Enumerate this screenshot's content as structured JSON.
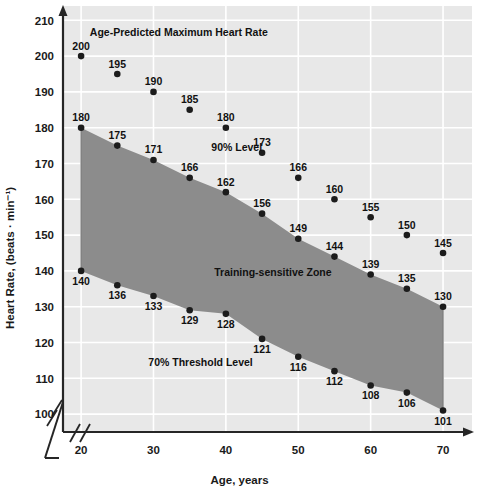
{
  "chart_data": {
    "type": "line",
    "title": "",
    "xlabel": "Age, years",
    "ylabel": "Heart Rate, (beats · min⁻¹)",
    "xlim": [
      17.5,
      74
    ],
    "ylim": [
      95,
      214
    ],
    "xticks": [
      20,
      30,
      40,
      50,
      60,
      70
    ],
    "yticks": [
      100,
      110,
      120,
      130,
      140,
      150,
      160,
      170,
      180,
      190,
      200,
      210
    ],
    "grid": true,
    "legend": "none",
    "axis_break_x": true,
    "axis_break_y": true,
    "x": [
      20,
      25,
      30,
      35,
      40,
      45,
      50,
      55,
      60,
      65,
      70
    ],
    "series": [
      {
        "name": "Age-Predicted Maximum Heart Rate",
        "values": [
          200,
          195,
          190,
          185,
          180,
          173,
          166,
          160,
          155,
          150,
          145
        ],
        "label_position": "above",
        "marker": "filled-circle",
        "line": false
      },
      {
        "name": "90% Level",
        "values": [
          180,
          175,
          171,
          166,
          162,
          156,
          149,
          144,
          139,
          135,
          130
        ],
        "label_position": "above",
        "marker": "filled-circle",
        "line": true
      },
      {
        "name": "70% Threshold Level",
        "values": [
          140,
          136,
          133,
          129,
          128,
          121,
          116,
          112,
          108,
          106,
          101
        ],
        "label_position": "below",
        "marker": "filled-circle",
        "line": true
      }
    ],
    "shaded_region": {
      "name": "Training-sensitive Zone",
      "upper_series": "90% Level",
      "lower_series": "70% Threshold Level",
      "color": "#8c8c8c"
    },
    "annotations": [
      {
        "text": "Age-Predicted Maximum Heart Rate",
        "x": 33.5,
        "y": 205.5
      },
      {
        "text": "90% Level",
        "x": 41.5,
        "y": 173.5
      },
      {
        "text": "Training-sensitive Zone",
        "x": 46.5,
        "y": 138.5
      },
      {
        "text": "70% Threshold Level",
        "x": 36.5,
        "y": 113.5
      }
    ],
    "colors": {
      "plot_background": "#e8e8e8",
      "gridline": "#ffffff",
      "axis": "#262626",
      "marker": "#1c1c1c",
      "zone_fill": "#8c8c8c",
      "text": "#111111"
    }
  },
  "axis": {
    "y_title": "Heart Rate, (beats · min⁻¹)",
    "x_title": "Age, years"
  },
  "annotations": {
    "max_hr": "Age-Predicted Maximum Heart Rate",
    "level90": "90% Level",
    "zone": "Training-sensitive Zone",
    "level70": "70% Threshold Level"
  }
}
